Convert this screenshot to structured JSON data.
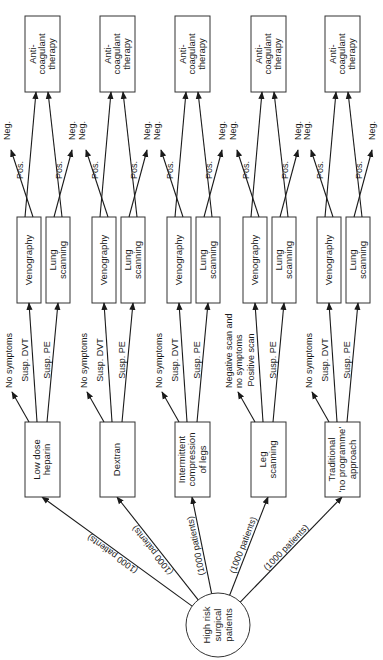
{
  "diagram": {
    "orientation": "rotated-90-ccw",
    "root": {
      "label_lines": [
        "High risk",
        "surgical",
        "patients"
      ]
    },
    "edge_label": "(1000 patients)",
    "strategies": [
      {
        "label_lines": [
          "Low dose",
          "heparin"
        ],
        "branches": {
          "none": "No symptoms",
          "a": "Susp. DVT",
          "b": "Susp. PE"
        }
      },
      {
        "label_lines": [
          "Dextran"
        ],
        "branches": {
          "none": "No symptoms",
          "a": "Susp. DVT",
          "b": "Susp. PE"
        }
      },
      {
        "label_lines": [
          "Intermittent",
          "compression",
          "of legs"
        ],
        "branches": {
          "none": "No symptoms",
          "a": "Susp. DVT",
          "b": "Susp. PE"
        }
      },
      {
        "label_lines": [
          "Leg",
          "scanning"
        ],
        "branches": {
          "none_lines": [
            "Negative scan and",
            "no symptoms"
          ],
          "a": "Positive scan",
          "b": "Susp. PE"
        }
      },
      {
        "label_lines": [
          "Traditional",
          "'no programme'",
          "approach"
        ],
        "branches": {
          "none": "No symptoms",
          "a": "Susp. DVT",
          "b": "Susp. PE"
        }
      }
    ],
    "tests": {
      "venography": [
        "Venography"
      ],
      "lung": [
        "Lung",
        "scanning"
      ]
    },
    "outcomes": {
      "pos": "Pos.",
      "neg": "Neg."
    },
    "therapy": {
      "label_lines": [
        "Anti-",
        "coagulant",
        "therapy"
      ]
    }
  }
}
